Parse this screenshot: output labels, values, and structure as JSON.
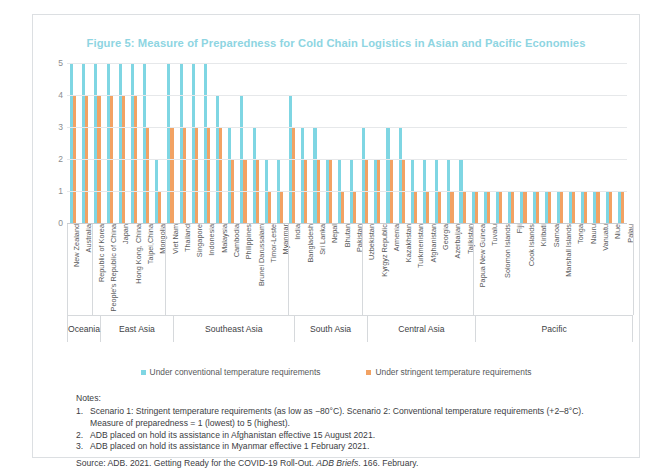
{
  "figure": {
    "title": "Figure 5: Measure of Preparedness for Cold Chain Logistics in Asian and Pacific Economies",
    "title_color": "#8ed5e2",
    "accent_rule_color": "#7fd3e0"
  },
  "legend": {
    "items": [
      {
        "label": "Under conventional temperature requirements",
        "color": "#7fd6e3",
        "key": "conventional"
      },
      {
        "label": "Under stringent temperature requirements",
        "color": "#f2a263",
        "key": "stringent"
      }
    ]
  },
  "notes": {
    "header": "Notes:",
    "items": [
      {
        "num": "1.",
        "text": "Scenario 1: Stringent temperature requirements (as low as −80°C). Scenario 2: Conventional temperature requirements (+2–8°C).",
        "cont": "Measure of preparedness = 1 (lowest) to 5 (highest)."
      },
      {
        "num": "2.",
        "text": "ADB placed on hold its assistance in Afghanistan effective 15 August 2021.",
        "cont": ""
      },
      {
        "num": "3.",
        "text": "ADB placed on hold its assistance in Myanmar effective 1 February 2021.",
        "cont": ""
      }
    ],
    "source_pre": "Source: ADB. 2021. Getting Ready for the COVID-19 Roll-Out. ",
    "source_em": "ADB Briefs",
    "source_post": ". 166. February."
  },
  "chart_data": {
    "type": "bar",
    "title": "Figure 5: Measure of Preparedness for Cold Chain Logistics in Asian and Pacific Economies",
    "xlabel": "",
    "ylabel": "",
    "ylim": [
      0,
      5
    ],
    "yticks": [
      0,
      1,
      2,
      3,
      4,
      5
    ],
    "grid": true,
    "legend_position": "bottom-center",
    "categories": [
      "New Zealand",
      "Australia",
      "Republic of Korea",
      "People's Republic of China",
      "Japan",
      "Hong Kong, China",
      "Taipei,China",
      "Mongolia",
      "Viet Nam",
      "Thailand",
      "Singapore",
      "Indonesia",
      "Malaysia",
      "Cambodia",
      "Philippines",
      "Brunei Darussalam",
      "Timor-Leste",
      "Myanmar",
      "India",
      "Bangladesh",
      "Sri Lanka",
      "Nepal",
      "Bhutan",
      "Pakistan",
      "Uzbekistan",
      "Kyrgyz Republic",
      "Armenia",
      "Kazakhstan",
      "Turkmenistan",
      "Afghanistan",
      "Georgia",
      "Azerbaijan",
      "Tajikistan",
      "Papua New Guinea",
      "Tuvalu",
      "Solomon Islands",
      "Fiji",
      "Cook Islands",
      "Kiribati",
      "Samoa",
      "Marshall Islands",
      "Tonga",
      "Nauru",
      "Vanuatu",
      "Niue",
      "Palau"
    ],
    "series": [
      {
        "name": "Under conventional temperature requirements",
        "color": "#7fd6e3",
        "values": [
          5,
          5,
          5,
          5,
          5,
          5,
          5,
          2,
          5,
          5,
          5,
          5,
          4,
          3,
          4,
          3,
          2,
          2,
          4,
          3,
          3,
          2,
          2,
          2,
          3,
          2,
          3,
          3,
          2,
          2,
          2,
          2,
          2,
          1,
          1,
          1,
          1,
          1,
          1,
          1,
          1,
          1,
          1,
          1,
          1,
          1
        ]
      },
      {
        "name": "Under stringent temperature requirements",
        "color": "#f2a263",
        "values": [
          4,
          4,
          4,
          4,
          4,
          4,
          3,
          1,
          3,
          3,
          3,
          3,
          3,
          2,
          2,
          2,
          1,
          1,
          3,
          2,
          2,
          2,
          1,
          1,
          2,
          2,
          2,
          2,
          1,
          1,
          1,
          1,
          1,
          1,
          1,
          1,
          1,
          1,
          1,
          1,
          1,
          1,
          1,
          1,
          1,
          1
        ]
      }
    ],
    "regions": [
      {
        "label": "Oceania",
        "count": 2
      },
      {
        "label": "East Asia",
        "count": 6
      },
      {
        "label": "Southeast Asia",
        "count": 10
      },
      {
        "label": "South Asia",
        "count": 6
      },
      {
        "label": "Central Asia",
        "count": 9
      },
      {
        "label": "Pacific",
        "count": 13
      }
    ]
  }
}
